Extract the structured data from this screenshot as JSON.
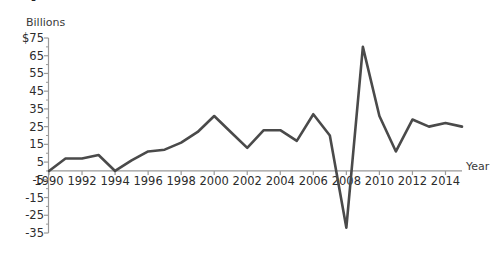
{
  "chart": {
    "clipped_title_fragment": "•",
    "y_unit_label": "Billions",
    "x_axis_title": "Year"
  },
  "chart_data": {
    "type": "line",
    "title": "",
    "xlabel": "Year",
    "ylabel": "Billions",
    "ylim": [
      -35,
      75
    ],
    "xlim": [
      1990,
      2015
    ],
    "grid": false,
    "legend": "none",
    "ytick_labels": [
      "$75",
      "65",
      "55",
      "45",
      "35",
      "25",
      "15",
      "5",
      "-5",
      "-15",
      "-25",
      "-35"
    ],
    "ytick_values": [
      75,
      65,
      55,
      45,
      35,
      25,
      15,
      5,
      -5,
      -15,
      -25,
      -35
    ],
    "minor_tick_values": [
      70,
      60,
      50,
      40,
      30,
      20,
      10,
      0,
      -10,
      -20,
      -30
    ],
    "xtick_labels": [
      "1990",
      "1992",
      "1994",
      "1996",
      "1998",
      "2000",
      "2002",
      "2004",
      "2006",
      "2008",
      "2010",
      "2012",
      "2014"
    ],
    "xtick_values": [
      1990,
      1992,
      1994,
      1996,
      1998,
      2000,
      2002,
      2004,
      2006,
      2008,
      2010,
      2012,
      2014
    ],
    "x": [
      1990,
      1991,
      1992,
      1993,
      1994,
      1995,
      1996,
      1997,
      1998,
      1999,
      2000,
      2001,
      2002,
      2003,
      2004,
      2005,
      2006,
      2007,
      2008,
      2009,
      2010,
      2011,
      2012,
      2013,
      2014,
      2015
    ],
    "values": [
      0,
      7,
      7,
      9,
      0,
      6,
      11,
      12,
      16,
      22,
      31,
      22,
      13,
      23,
      23,
      17,
      32,
      20,
      -32,
      70,
      31,
      11,
      29,
      25,
      27,
      25
    ],
    "series_color": "#4a4a4a",
    "axis_color": "#9a9a9a"
  }
}
